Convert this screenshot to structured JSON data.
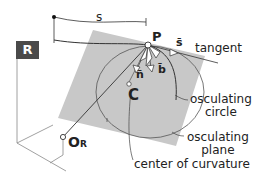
{
  "diagram": {
    "frame_label": "R",
    "arc_length_label": "s",
    "point_label": "P",
    "unit_tangent_label": "s̄",
    "normal_label": "n̄",
    "binormal_label": "b̄",
    "center_label": "C",
    "origin_label": "O",
    "origin_subscript": "R",
    "callouts": {
      "tangent": "tangent",
      "osculating_circle": [
        "osculating",
        "circle"
      ],
      "osculating_plane": [
        "osculating",
        "plane"
      ],
      "center_of_curvature": "center of curvature"
    },
    "colors": {
      "plane": "#c8c8c8",
      "frame_box": "#4a4a4a",
      "line": "#333333"
    }
  }
}
